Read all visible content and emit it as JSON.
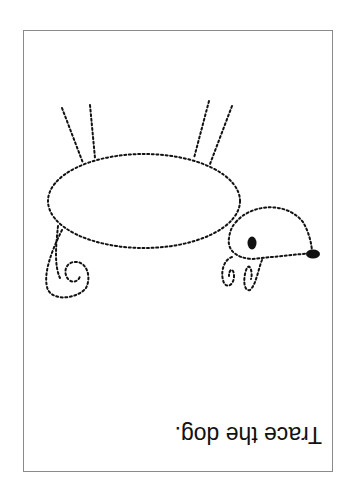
{
  "worksheet": {
    "instruction": "Trace the dog.",
    "orientation": "rotated 180 degrees",
    "subject": "dog",
    "line_style": "dotted",
    "colors": {
      "ink": "#111111",
      "border": "#8a8a8a",
      "background": "#ffffff"
    }
  }
}
